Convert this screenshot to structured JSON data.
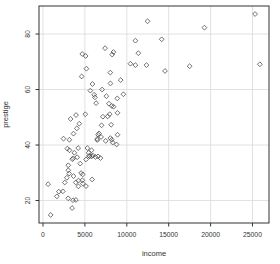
{
  "figure": {
    "background": "#ffffff"
  },
  "style": {
    "marker_color": "#4d4d4d",
    "grid_color": "#d9d9d9",
    "axis_color": "#333333",
    "text_color": "#333333"
  },
  "chart_data": {
    "type": "scatter",
    "title": "",
    "xlabel": "income",
    "ylabel": "prestige",
    "xlim": [
      -477,
      26969
    ],
    "ylim": [
      11.9,
      90.1
    ],
    "x_ticks": [
      0,
      5000,
      10000,
      15000,
      20000,
      25000
    ],
    "y_ticks": [
      20,
      40,
      60,
      80
    ],
    "grid": true,
    "legend_position": "none",
    "marker": "open-diamond",
    "series": [
      {
        "name": "occupations",
        "points": [
          [
            12351,
            68.8
          ],
          [
            25879,
            69.1
          ],
          [
            9271,
            63.4
          ],
          [
            8865,
            56.8
          ],
          [
            8403,
            73.5
          ],
          [
            11030,
            77.6
          ],
          [
            8258,
            72.6
          ],
          [
            14163,
            78.1
          ],
          [
            11377,
            73.1
          ],
          [
            11023,
            68.8
          ],
          [
            5902,
            62.0
          ],
          [
            7059,
            60.0
          ],
          [
            8425,
            53.8
          ],
          [
            8049,
            62.2
          ],
          [
            7405,
            74.9
          ],
          [
            6336,
            55.1
          ],
          [
            19263,
            82.3
          ],
          [
            6112,
            58.1
          ],
          [
            9593,
            58.3
          ],
          [
            4686,
            72.8
          ],
          [
            12480,
            84.6
          ],
          [
            5648,
            59.6
          ],
          [
            8034,
            66.1
          ],
          [
            25308,
            87.2
          ],
          [
            14558,
            66.7
          ],
          [
            17498,
            68.4
          ],
          [
            4614,
            64.7
          ],
          [
            3485,
            34.9
          ],
          [
            5092,
            72.1
          ],
          [
            10432,
            69.3
          ],
          [
            5180,
            67.5
          ],
          [
            6197,
            57.2
          ],
          [
            7562,
            57.6
          ],
          [
            8206,
            54.1
          ],
          [
            4036,
            46.0
          ],
          [
            3148,
            41.9
          ],
          [
            3295,
            49.4
          ],
          [
            2448,
            42.3
          ],
          [
            4330,
            47.7
          ],
          [
            3016,
            30.9
          ],
          [
            3016,
            32.7
          ],
          [
            2901,
            38.7
          ],
          [
            5511,
            36.1
          ],
          [
            3739,
            37.2
          ],
          [
            3161,
            38.1
          ],
          [
            4741,
            29.4
          ],
          [
            5052,
            51.1
          ],
          [
            6259,
            35.7
          ],
          [
            4075,
            35.6
          ],
          [
            7482,
            41.5
          ],
          [
            8780,
            40.2
          ],
          [
            2594,
            26.5
          ],
          [
            918,
            14.8
          ],
          [
            2370,
            23.3
          ],
          [
            8131,
            47.3
          ],
          [
            6992,
            47.1
          ],
          [
            7956,
            51.1
          ],
          [
            8895,
            43.7
          ],
          [
            8891,
            51.6
          ],
          [
            3116,
            29.7
          ],
          [
            3930,
            20.2
          ],
          [
            7869,
            54.9
          ],
          [
            611,
            25.9
          ],
          [
            3000,
            20.8
          ],
          [
            3472,
            17.3
          ],
          [
            3582,
            20.1
          ],
          [
            3643,
            44.1
          ],
          [
            1656,
            21.5
          ],
          [
            6860,
            35.3
          ],
          [
            4199,
            38.9
          ],
          [
            5134,
            25.2
          ],
          [
            5134,
            34.8
          ],
          [
            1890,
            23.2
          ],
          [
            4443,
            33.3
          ],
          [
            3643,
            28.8
          ],
          [
            8043,
            42.5
          ],
          [
            6686,
            44.2
          ],
          [
            6565,
            35.9
          ],
          [
            6477,
            41.8
          ],
          [
            5811,
            35.9
          ],
          [
            6573,
            43.7
          ],
          [
            3942,
            50.8
          ],
          [
            5449,
            37.2
          ],
          [
            2847,
            28.2
          ],
          [
            5795,
            38.1
          ],
          [
            7716,
            50.3
          ],
          [
            4696,
            27.3
          ],
          [
            8316,
            40.9
          ],
          [
            7147,
            50.2
          ],
          [
            3910,
            26.5
          ],
          [
            5299,
            38.9
          ],
          [
            5959,
            36.2
          ],
          [
            4549,
            29.9
          ],
          [
            6928,
            42.9
          ],
          [
            8206,
            41.9
          ],
          [
            5864,
            27.6
          ],
          [
            4226,
            27.2
          ],
          [
            4753,
            26.1
          ],
          [
            6462,
            42.2
          ],
          [
            3617,
            35.2
          ],
          [
            5562,
            35.9
          ],
          [
            4224,
            25.1
          ]
        ]
      }
    ]
  }
}
